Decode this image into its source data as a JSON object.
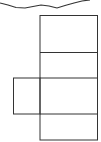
{
  "diagram": {
    "type": "cube-net-fragment",
    "stroke_color": "#333333",
    "background": "#ffffff",
    "torn_edge": {
      "points": "0,3 8,5 16,7.5 25,8 33,6.5 41,5 49,6 57,8 65,5.5 74,3 82,1 90,0"
    },
    "main_column": {
      "x": 40,
      "y": 15.5,
      "width": 57.5,
      "height": 124.5
    },
    "dividers": [
      52.5,
      78,
      114
    ],
    "side_square": {
      "x": 13.5,
      "y": 78,
      "width": 26.5,
      "height": 36
    }
  }
}
